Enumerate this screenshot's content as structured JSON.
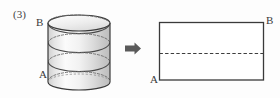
{
  "figure": {
    "item_number": "(3)",
    "background_color": "#fdfdfd",
    "stroke_color": "#3a3a3a",
    "dash_color": "#555555",
    "arrow_color": "#555555",
    "cylinder": {
      "label_top": "B",
      "label_bottom": "A",
      "shading_light": "#fdfdfd",
      "shading_mid": "#e8e8e8",
      "shading_dark": "#c9c9c9",
      "turns": 3,
      "description": "right circular cylinder with helical path wound from A at lower left to B at upper left"
    },
    "arrow": {
      "icon": "right-arrow-icon",
      "direction": "right"
    },
    "rectangle": {
      "label_top_right": "B",
      "label_bottom_left": "A",
      "dashed_line": "horizontal dashed segment spanning full width at mid height",
      "description": "unrolled lateral surface of the cylinder as a rectangle"
    }
  }
}
